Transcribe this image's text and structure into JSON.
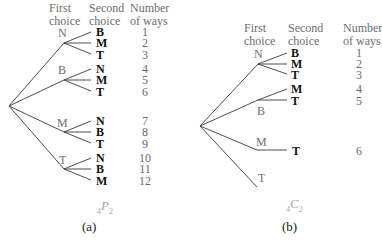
{
  "panel_a": {
    "headers": {
      "first": "First\nchoice",
      "second": "Second\nchoice",
      "ways": "Number\nof ways",
      "first_l1": "First",
      "first_l2": "choice",
      "second_l1": "Second",
      "second_l2": "choice",
      "ways_l1": "Number",
      "ways_l2": "of ways"
    },
    "first_choices": [
      "N",
      "B",
      "M",
      "T"
    ],
    "second_choices": [
      [
        "B",
        "M",
        "T"
      ],
      [
        "N",
        "M",
        "T"
      ],
      [
        "N",
        "B",
        "T"
      ],
      [
        "N",
        "B",
        "M"
      ]
    ],
    "second_flat": [
      "B",
      "M",
      "T",
      "N",
      "M",
      "T",
      "N",
      "B",
      "T",
      "N",
      "B",
      "M"
    ],
    "numbers": [
      "1",
      "2",
      "3",
      "4",
      "5",
      "6",
      "7",
      "8",
      "9",
      "10",
      "11",
      "12"
    ],
    "symbol": {
      "pre": "4",
      "letter": "P",
      "sub": "2"
    },
    "caption": "(a)"
  },
  "panel_b": {
    "headers": {
      "first_l1": "First",
      "first_l2": "choice",
      "second_l1": "Second",
      "second_l2": "choice",
      "ways_l1": "Number",
      "ways_l2": "of ways"
    },
    "first_choices": [
      "N",
      "B",
      "M",
      "T"
    ],
    "second_choices": [
      [
        "B",
        "M",
        "T"
      ],
      [
        "M",
        "T"
      ],
      [
        "T"
      ],
      []
    ],
    "second_flat": [
      "B",
      "M",
      "T",
      "M",
      "T",
      "T"
    ],
    "numbers": [
      "1",
      "2",
      "3",
      "4",
      "5",
      "6"
    ],
    "symbol": {
      "pre": "4",
      "letter": "C",
      "sub": "2"
    },
    "caption": "(b)"
  },
  "colors": {
    "line": "#3a3a3a",
    "label_gray": "#707070",
    "bold_text": "#111111",
    "symbol_gray": "#a8a8a8"
  }
}
